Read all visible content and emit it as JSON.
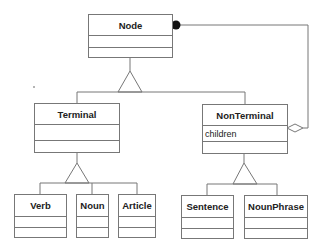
{
  "diagram": {
    "type": "uml-class-diagram",
    "classes": {
      "node": {
        "name": "Node",
        "attributes": ""
      },
      "terminal": {
        "name": "Terminal",
        "attributes": ""
      },
      "nonterminal": {
        "name": "NonTerminal",
        "attributes": "children"
      },
      "verb": {
        "name": "Verb"
      },
      "noun": {
        "name": "Noun"
      },
      "article": {
        "name": "Article"
      },
      "sentence": {
        "name": "Sentence"
      },
      "nounphrase": {
        "name": "NounPhrase"
      }
    },
    "relations": [
      {
        "type": "generalization",
        "from": "Terminal",
        "to": "Node"
      },
      {
        "type": "generalization",
        "from": "NonTerminal",
        "to": "Node"
      },
      {
        "type": "generalization",
        "from": "Verb",
        "to": "Terminal"
      },
      {
        "type": "generalization",
        "from": "Noun",
        "to": "Terminal"
      },
      {
        "type": "generalization",
        "from": "Article",
        "to": "Terminal"
      },
      {
        "type": "generalization",
        "from": "Sentence",
        "to": "NonTerminal"
      },
      {
        "type": "generalization",
        "from": "NounPhrase",
        "to": "NonTerminal"
      },
      {
        "type": "aggregation",
        "whole": "NonTerminal",
        "part": "Node",
        "role": "children"
      }
    ],
    "colors": {
      "line": "#777777",
      "text": "#222222"
    }
  }
}
